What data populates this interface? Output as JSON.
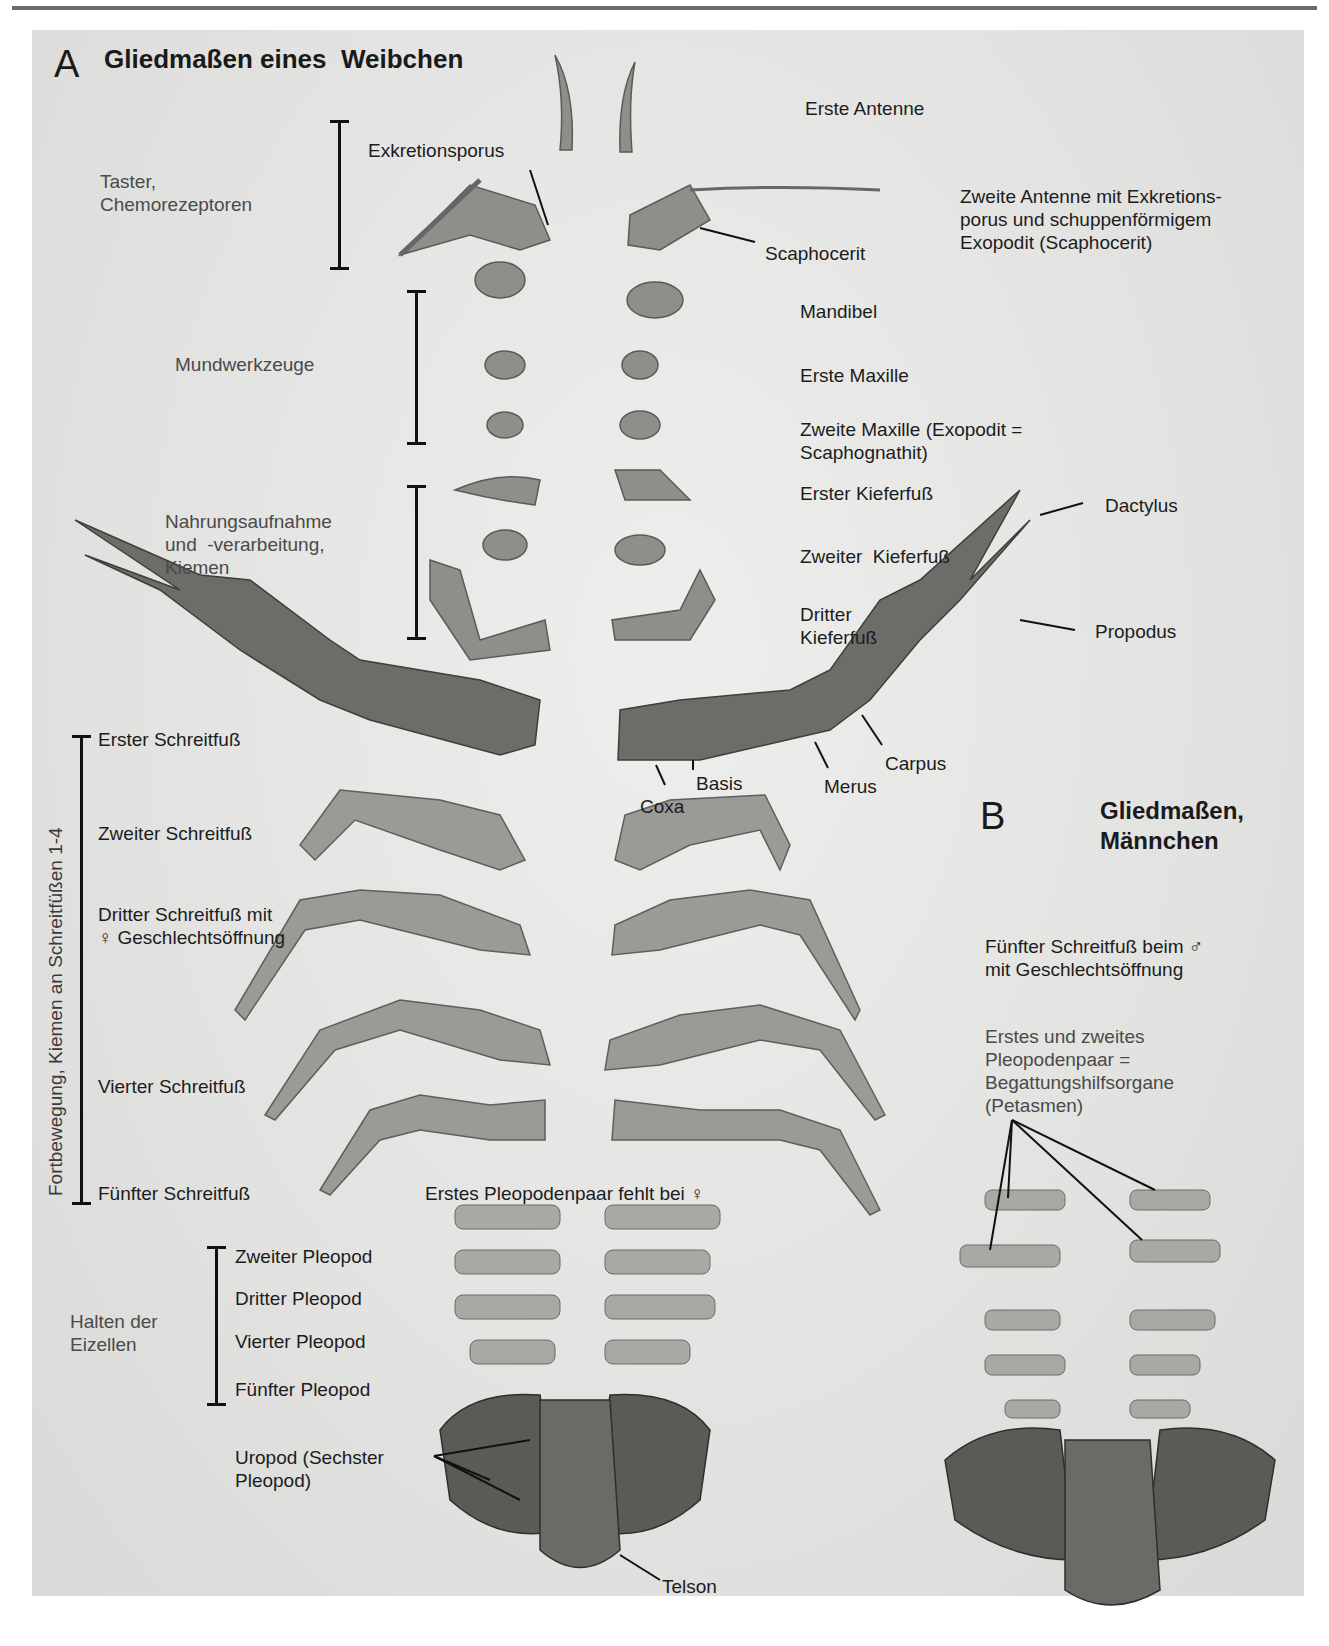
{
  "panel_a": {
    "letter": "A",
    "title": "Gliedmaßen eines  Weibchen",
    "functions": {
      "taster": "Taster,\nChemorezeptoren",
      "mundwerkzeuge": "Mundwerkzeuge",
      "nahrung": "Nahrungsaufnahme\nund  -verarbeitung,\nKiemen",
      "fortbewegung": "Fortbewegung, Kiemen an Schreitfüßen 1-4",
      "halten": "Halten der\nEizellen"
    },
    "appendages_right": {
      "erste_antenne": "Erste Antenne",
      "zweite_antenne": "Zweite Antenne mit Exkretions-\nporus und schuppenförmigem\nExopodit (Scaphocerit)",
      "scaphocerit": "Scaphocerit",
      "exkretionsporus": "Exkretionsporus",
      "mandibel": "Mandibel",
      "erste_maxille": "Erste Maxille",
      "zweite_maxille": "Zweite Maxille (Exopodit =\nScaphognathit)",
      "erster_kieferfuss": "Erster Kieferfuß",
      "zweiter_kieferfuss": "Zweiter  Kieferfuß",
      "dritter_kieferfuss": "Dritter\nKieferfuß"
    },
    "claw_parts": {
      "dactylus": "Dactylus",
      "propodus": "Propodus",
      "carpus": "Carpus",
      "merus": "Merus",
      "basis": "Basis",
      "coxa": "Coxa"
    },
    "schreitfuesse": [
      "Erster Schreitfuß",
      "Zweiter Schreitfuß",
      "Dritter Schreitfuß mit\n♀ Geschlechtsöffnung",
      "Vierter Schreitfuß",
      "Fünfter Schreitfuß"
    ],
    "pleopod_note": "Erstes Pleopodenpaar fehlt bei ♀",
    "pleopoden": [
      "Zweiter Pleopod",
      "Dritter Pleopod",
      "Vierter Pleopod",
      "Fünfter Pleopod"
    ],
    "uropod": "Uropod (Sechster\nPleopod)",
    "telson": "Telson"
  },
  "panel_b": {
    "letter": "B",
    "title": "Gliedmaßen,\nMännchen",
    "fuenfter": "Fünfter Schreitfuß beim ♂\nmit Geschlechtsöffnung",
    "petasmen": "Erstes und zweites\nPleopodenpaar =\nBegattungshilfsorgane\n(Petasmen)"
  },
  "colors": {
    "background": "#e3e3e1",
    "specimen": "#8a8a86",
    "specimen_dark": "#4e4e4b",
    "text": "#1c1c1c"
  }
}
